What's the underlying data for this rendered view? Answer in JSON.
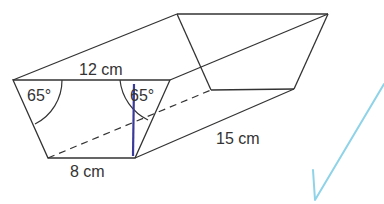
{
  "diagram": {
    "labels": {
      "top_edge": "12 cm",
      "bottom_edge": "8 cm",
      "length": "15 cm",
      "angle_left": "65°",
      "angle_right": "65°"
    },
    "colors": {
      "edge": "#333333",
      "height_line": "#3a3a9a",
      "checkmark": "#8fd3e8"
    }
  }
}
